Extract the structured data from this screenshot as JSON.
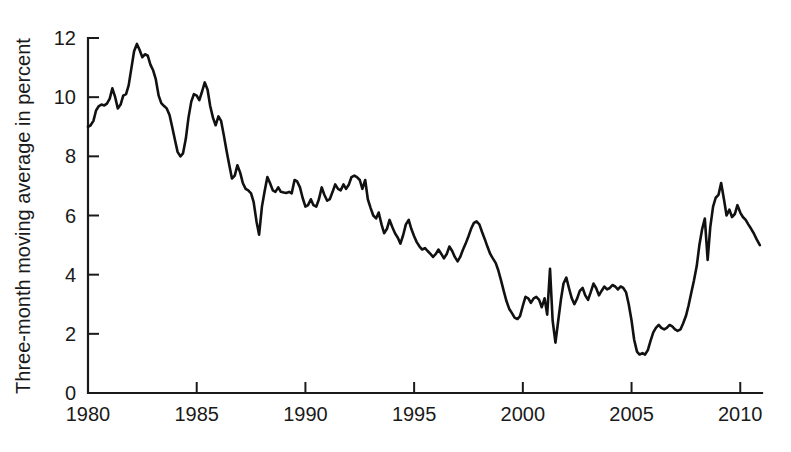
{
  "chart_data": {
    "type": "line",
    "title": "",
    "xlabel": "",
    "ylabel": "Three-month moving average in percent",
    "xlim": [
      1980,
      2011
    ],
    "ylim": [
      0,
      12
    ],
    "grid": false,
    "legend": false,
    "x_ticks": [
      1980,
      1985,
      1990,
      1995,
      2000,
      2005,
      2010
    ],
    "x_tick_labels": [
      "1980",
      "1985",
      "1990",
      "1995",
      "2000",
      "2005",
      "2010"
    ],
    "y_ticks": [
      0,
      2,
      4,
      6,
      8,
      10,
      12
    ],
    "y_tick_labels": [
      "0",
      "2",
      "4",
      "6",
      "8",
      "10",
      "12"
    ],
    "line_color": "#111111",
    "series": [
      {
        "name": "Three-month moving average",
        "x": [
          1980.0,
          1980.12,
          1980.25,
          1980.37,
          1980.5,
          1980.62,
          1980.75,
          1980.87,
          1981.0,
          1981.12,
          1981.25,
          1981.37,
          1981.5,
          1981.62,
          1981.75,
          1981.87,
          1982.0,
          1982.12,
          1982.25,
          1982.37,
          1982.5,
          1982.62,
          1982.75,
          1982.87,
          1983.0,
          1983.12,
          1983.25,
          1983.37,
          1983.5,
          1983.62,
          1983.75,
          1983.87,
          1984.0,
          1984.12,
          1984.25,
          1984.37,
          1984.5,
          1984.62,
          1984.75,
          1984.87,
          1985.0,
          1985.12,
          1985.25,
          1985.37,
          1985.5,
          1985.62,
          1985.75,
          1985.87,
          1986.0,
          1986.12,
          1986.25,
          1986.37,
          1986.5,
          1986.62,
          1986.75,
          1986.87,
          1987.0,
          1987.12,
          1987.25,
          1987.37,
          1987.5,
          1987.62,
          1987.75,
          1987.87,
          1988.0,
          1988.12,
          1988.25,
          1988.37,
          1988.5,
          1988.62,
          1988.75,
          1988.87,
          1989.0,
          1989.12,
          1989.25,
          1989.37,
          1989.5,
          1989.62,
          1989.75,
          1989.87,
          1990.0,
          1990.12,
          1990.25,
          1990.37,
          1990.5,
          1990.62,
          1990.75,
          1990.87,
          1991.0,
          1991.12,
          1991.25,
          1991.37,
          1991.5,
          1991.62,
          1991.75,
          1991.87,
          1992.0,
          1992.12,
          1992.25,
          1992.37,
          1992.5,
          1992.62,
          1992.75,
          1992.87,
          1993.0,
          1993.12,
          1993.25,
          1993.37,
          1993.5,
          1993.62,
          1993.75,
          1993.87,
          1994.0,
          1994.12,
          1994.25,
          1994.37,
          1994.5,
          1994.62,
          1994.75,
          1994.87,
          1995.0,
          1995.12,
          1995.25,
          1995.37,
          1995.5,
          1995.62,
          1995.75,
          1995.87,
          1996.0,
          1996.12,
          1996.25,
          1996.37,
          1996.5,
          1996.62,
          1996.75,
          1996.87,
          1997.0,
          1997.12,
          1997.25,
          1997.37,
          1997.5,
          1997.62,
          1997.75,
          1997.87,
          1998.0,
          1998.12,
          1998.25,
          1998.37,
          1998.5,
          1998.62,
          1998.75,
          1998.87,
          1999.0,
          1999.12,
          1999.25,
          1999.37,
          1999.5,
          1999.62,
          1999.75,
          1999.87,
          2000.0,
          2000.12,
          2000.25,
          2000.37,
          2000.5,
          2000.62,
          2000.75,
          2000.87,
          2001.0,
          2001.12,
          2001.25,
          2001.37,
          2001.5,
          2001.62,
          2001.75,
          2001.87,
          2002.0,
          2002.12,
          2002.25,
          2002.37,
          2002.5,
          2002.62,
          2002.75,
          2002.87,
          2003.0,
          2003.12,
          2003.25,
          2003.37,
          2003.5,
          2003.62,
          2003.75,
          2003.87,
          2004.0,
          2004.12,
          2004.25,
          2004.37,
          2004.5,
          2004.62,
          2004.75,
          2004.87,
          2005.0,
          2005.12,
          2005.25,
          2005.37,
          2005.5,
          2005.62,
          2005.75,
          2005.87,
          2006.0,
          2006.12,
          2006.25,
          2006.37,
          2006.5,
          2006.62,
          2006.75,
          2006.87,
          2007.0,
          2007.12,
          2007.25,
          2007.37,
          2007.5,
          2007.62,
          2007.75,
          2007.87,
          2008.0,
          2008.12,
          2008.25,
          2008.37,
          2008.5,
          2008.62,
          2008.75,
          2008.87,
          2009.0,
          2009.12,
          2009.25,
          2009.37,
          2009.5,
          2009.62,
          2009.75,
          2009.87,
          2010.0,
          2010.12,
          2010.25,
          2010.37,
          2010.5,
          2010.62,
          2010.75,
          2010.9
        ],
        "y": [
          9.0,
          9.05,
          9.2,
          9.55,
          9.7,
          9.75,
          9.72,
          9.78,
          9.95,
          10.3,
          10.0,
          9.62,
          9.75,
          10.05,
          10.1,
          10.4,
          11.0,
          11.55,
          11.8,
          11.6,
          11.35,
          11.45,
          11.4,
          11.1,
          10.9,
          10.6,
          10.05,
          9.8,
          9.7,
          9.62,
          9.4,
          9.0,
          8.55,
          8.15,
          8.0,
          8.1,
          8.6,
          9.3,
          9.85,
          10.1,
          10.05,
          9.9,
          10.2,
          10.5,
          10.25,
          9.7,
          9.3,
          9.05,
          9.35,
          9.2,
          8.7,
          8.2,
          7.7,
          7.25,
          7.35,
          7.7,
          7.45,
          7.1,
          6.9,
          6.85,
          6.75,
          6.45,
          5.8,
          5.35,
          6.3,
          6.8,
          7.3,
          7.1,
          6.85,
          6.8,
          6.95,
          6.8,
          6.78,
          6.76,
          6.8,
          6.75,
          7.2,
          7.15,
          6.95,
          6.6,
          6.3,
          6.35,
          6.55,
          6.35,
          6.3,
          6.55,
          6.95,
          6.7,
          6.5,
          6.55,
          6.8,
          7.05,
          6.9,
          6.85,
          7.05,
          6.9,
          7.05,
          7.3,
          7.35,
          7.3,
          7.2,
          6.9,
          7.2,
          6.55,
          6.25,
          6.0,
          5.9,
          6.1,
          5.7,
          5.4,
          5.55,
          5.85,
          5.6,
          5.4,
          5.25,
          5.05,
          5.35,
          5.7,
          5.85,
          5.55,
          5.3,
          5.1,
          4.95,
          4.85,
          4.9,
          4.8,
          4.7,
          4.6,
          4.7,
          4.85,
          4.7,
          4.55,
          4.7,
          4.95,
          4.8,
          4.6,
          4.45,
          4.6,
          4.85,
          5.05,
          5.3,
          5.55,
          5.75,
          5.8,
          5.7,
          5.45,
          5.2,
          4.95,
          4.7,
          4.55,
          4.4,
          4.15,
          3.8,
          3.45,
          3.1,
          2.85,
          2.7,
          2.55,
          2.5,
          2.6,
          2.95,
          3.25,
          3.2,
          3.05,
          3.2,
          3.25,
          3.15,
          2.9,
          3.2,
          2.65,
          4.2,
          2.45,
          1.7,
          2.4,
          3.15,
          3.7,
          3.9,
          3.55,
          3.2,
          3.0,
          3.2,
          3.45,
          3.55,
          3.3,
          3.15,
          3.4,
          3.7,
          3.55,
          3.3,
          3.45,
          3.6,
          3.5,
          3.55,
          3.65,
          3.6,
          3.5,
          3.6,
          3.55,
          3.4,
          3.0,
          2.45,
          1.8,
          1.4,
          1.3,
          1.35,
          1.3,
          1.45,
          1.75,
          2.05,
          2.2,
          2.3,
          2.2,
          2.15,
          2.2,
          2.3,
          2.25,
          2.15,
          2.1,
          2.15,
          2.35,
          2.6,
          2.95,
          3.4,
          3.8,
          4.3,
          5.0,
          5.55,
          5.9,
          4.5,
          5.6,
          6.3,
          6.6,
          6.7,
          7.1,
          6.55,
          6.0,
          6.2,
          5.95,
          6.05,
          6.35,
          6.1,
          5.95,
          5.85,
          5.7,
          5.55,
          5.4,
          5.2,
          5.0
        ]
      }
    ]
  }
}
